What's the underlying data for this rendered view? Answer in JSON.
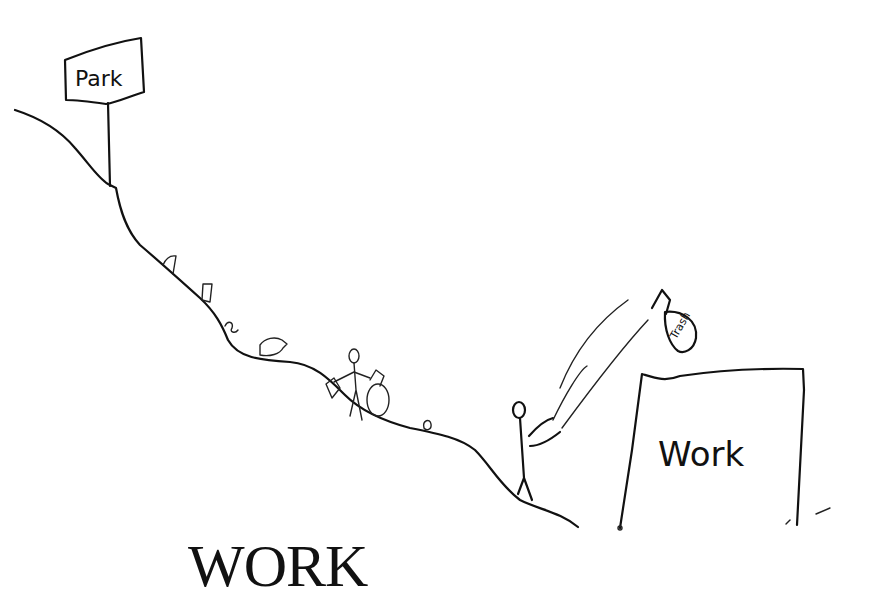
{
  "illustration": {
    "park_sign": {
      "label": "Park"
    },
    "work_building": {
      "label": "Work"
    },
    "trash_bag": {
      "label": "Trash"
    },
    "scene_elements": [
      "hillside-slope",
      "park-sign",
      "litter-items",
      "person-picking-up-litter",
      "person-throwing-trash",
      "flying-trash-bag",
      "work-building"
    ]
  },
  "caption": {
    "text": "WORK"
  },
  "colors": {
    "ink": "#111111",
    "background": "#ffffff"
  }
}
